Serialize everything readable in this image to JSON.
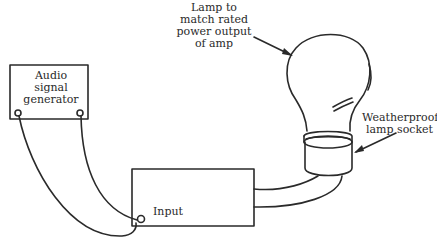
{
  "diagram": {
    "components": {
      "generator": {
        "lines": [
          "Audio",
          "signal",
          "generator"
        ]
      },
      "amplifier": {
        "input_label": "Input"
      },
      "lamp_note": {
        "lines": [
          "Lamp to",
          "match rated",
          "power output",
          "of amp"
        ]
      },
      "socket_note": {
        "lines": [
          "Weatherproof",
          "lamp socket"
        ]
      }
    },
    "colors": {
      "stroke": "#2a2a2a",
      "background": "#ffffff"
    }
  }
}
